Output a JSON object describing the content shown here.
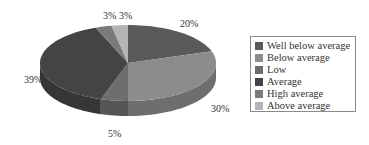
{
  "chart_data": {
    "type": "pie",
    "style": "3d",
    "title": "",
    "categories": [
      "Well below average",
      "Below average",
      "Low",
      "Average",
      "High average",
      "Above average"
    ],
    "values": [
      20,
      30,
      5,
      39,
      3,
      3
    ],
    "labels": [
      "20%",
      "30%",
      "5%",
      "39%",
      "3%",
      "3%"
    ],
    "colors": [
      "#5a5a5a",
      "#8c8c8c",
      "#6e6e6e",
      "#444444",
      "#7a7a7a",
      "#b4b4b4"
    ],
    "side_colors": [
      "#484848",
      "#6e6e6e",
      "#565656",
      "#363636",
      "#606060",
      "#909090"
    ],
    "start_angle_deg": 0,
    "direction": "clockwise",
    "legend_position": "right"
  },
  "legend": {
    "items": [
      {
        "label": "Well below average",
        "color": "#5a5a5a"
      },
      {
        "label": "Below average",
        "color": "#8c8c8c"
      },
      {
        "label": "Low",
        "color": "#6e6e6e"
      },
      {
        "label": "Average",
        "color": "#444444"
      },
      {
        "label": "High average",
        "color": "#7a7a7a"
      },
      {
        "label": "Above average",
        "color": "#b4b4b4"
      }
    ]
  },
  "data_labels": [
    {
      "text": "20%",
      "x": 180,
      "y": 18
    },
    {
      "text": "30%",
      "x": 211,
      "y": 103
    },
    {
      "text": "5%",
      "x": 108,
      "y": 128
    },
    {
      "text": "39%",
      "x": 24,
      "y": 74
    },
    {
      "text": "3%",
      "x": 103,
      "y": 10
    },
    {
      "text": "3%",
      "x": 119,
      "y": 10
    }
  ]
}
